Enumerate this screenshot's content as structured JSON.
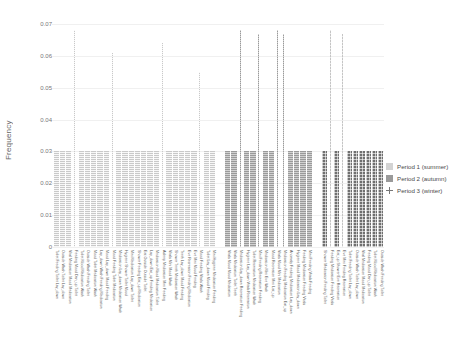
{
  "chart_data": {
    "type": "bar",
    "title": "",
    "xlabel": "",
    "ylabel": "Frequency",
    "ylim": [
      0,
      0.07
    ],
    "yticks": [
      "0",
      "0.01",
      "0.02",
      "0.03",
      "0.04",
      "0.05",
      "0.06",
      "0.07"
    ],
    "grid": true,
    "legend_position": "right",
    "legend": [
      {
        "name": "Period 1 (summer)",
        "marker": "light-grey-square",
        "color": "#d3d3d3"
      },
      {
        "name": "Period 2 (autumn)",
        "marker": "grey-square",
        "color": "#9a9a9a"
      },
      {
        "name": "Period 3 (winter)",
        "marker": "plus-cross",
        "color": "#777777"
      }
    ],
    "categories": [
      "Toilet Feeding Toilet Lay_down",
      "Outside Wash Toilet Lay_down",
      "Vital Medication Mood Medication",
      "Feeding Mood Dan_up Toilet",
      "Toilet Mood Medication Wash",
      "Outside Wash Feeding Toilet",
      "Mood Toilet Medication Wash",
      "Lay_down Wash Feeding Medication",
      "Mood Lay_down Mood Feeding",
      "Mood Feeding Toilet Medication",
      "Medication Lay_down Medication Wash",
      "Hygiene Shower Toilet Mood",
      "Mini Medication Lay_down Toilet",
      "Shower Feeding Eat_up Medication",
      "Eat Outside Outside Toilet",
      "Lay_down Eat_up Feeding Medication",
      "Medication Mood Medication Toilet",
      "Asleep Medication Mini Feeding",
      "Vitals Mini Mood Wash",
      "Shower Teeth Medication Wash",
      "Teeth Lay_down Mood Feeding",
      "Eve Recreation Feeding Medication",
      "Eve Mini Mood Feeding",
      "Mood Feeding Vitals Wash",
      "Toilet Lay_down Mood Feeding",
      "Mini Hygiene Medication Feeding",
      "Vitals Mood Mood Medication",
      "Vitals Medication Toilet Teeth",
      "Medication Lay_down Recreation Feeding",
      "Hygiene Lay_down Vitals Recreation",
      "Toilet Recreation Medication Wash",
      "Mini Feeding Recreation Feeding",
      "Medication Mini Eve Wash",
      "Mood Recreation Mini List_up",
      "Vitals Mood Mini Medication",
      "Medication Feeding Medication Eat_up",
      "Anomaly Feeding Medication Lay_down",
      "Hygiene Mood Medication Lay_down",
      "Feeding Medication Feeding Vitals",
      "Mini Feeding Vitals Feeding",
      "Shower Medication Feeding Toilet",
      "Feeding Medication Feeding Vitals",
      "Eat_up Shower Eve Recreation",
      "Eve Mini Feeding Recreation"
    ],
    "series": [
      {
        "name": "Period 1 (summer)",
        "color": "#c9c9c9",
        "values": [
          0.03,
          0.03,
          0.03,
          0.03,
          0.03,
          0.03,
          0.03,
          0.03,
          0.03,
          0.03,
          0.03,
          0.03,
          0.03,
          0.03,
          0.03,
          0.03,
          0.03,
          0.03,
          0.03,
          0.03,
          0.03,
          0.03,
          0.03,
          0.03,
          0.03,
          0.03,
          0.03,
          0.03,
          0.03,
          0.03,
          0.03,
          0.03,
          0.03,
          0.03,
          0.03,
          0.03,
          0.03,
          0.03,
          0.03,
          0.03,
          0.03,
          0.03,
          0.03,
          0.03
        ]
      }
    ],
    "bars": [
      {
        "region": "left",
        "period": "Period 1 (summer)",
        "style": "p1",
        "count": 26,
        "height": 0.03,
        "spikes": [
          {
            "index": 3,
            "height": 0.068
          },
          {
            "index": 9,
            "height": 0.061
          },
          {
            "index": 17,
            "height": 0.064
          },
          {
            "index": 23,
            "height": 0.055
          }
        ]
      },
      {
        "region": "middle",
        "period": "Period 2 (autumn)",
        "style": "p2",
        "count": 14,
        "height": 0.03,
        "spikes": [
          {
            "index": 2,
            "height": 0.068
          },
          {
            "index": 5,
            "height": 0.067
          },
          {
            "index": 8,
            "height": 0.068
          },
          {
            "index": 9,
            "height": 0.067
          }
        ]
      },
      {
        "region": "right",
        "period": "Period 3 (winter)",
        "style": "p3",
        "count": 10,
        "height": 0.03,
        "spikes": [
          {
            "index": 1,
            "height": 0.068
          },
          {
            "index": 3,
            "height": 0.067
          }
        ]
      }
    ]
  },
  "axis": {
    "y_label": "Frequency",
    "y_ticks": [
      "0.07",
      "0.06",
      "0.05",
      "0.04",
      "0.03",
      "0.02",
      "0.01",
      "0"
    ]
  },
  "legend": {
    "items": [
      {
        "label": "Period 1 (summer)"
      },
      {
        "label": "Period 2 (autumn)"
      },
      {
        "label": "Period 3 (winter)"
      }
    ]
  }
}
